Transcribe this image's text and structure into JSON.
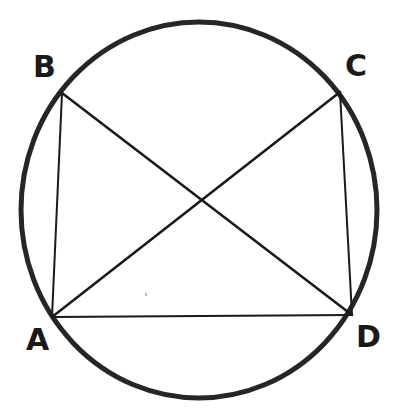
{
  "figure": {
    "background_color": "#ffffff",
    "stroke_color": "#1a1a1a",
    "circle_stroke_color": "#262626",
    "canvas": {
      "width": 403,
      "height": 420
    }
  },
  "circle": {
    "name": "circumscribed-circle",
    "cx": 199,
    "cy": 210,
    "rx": 178,
    "ry": 188,
    "stroke_width": 5
  },
  "vertices": [
    {
      "id": "A",
      "label": "A",
      "x": 52,
      "y": 317,
      "label_x": 26,
      "label_y": 325
    },
    {
      "id": "B",
      "label": "B",
      "x": 62,
      "y": 93,
      "label_x": 33,
      "label_y": 52
    },
    {
      "id": "C",
      "label": "C",
      "x": 340,
      "y": 92,
      "label_x": 345,
      "label_y": 51
    },
    {
      "id": "D",
      "label": "D",
      "x": 352,
      "y": 315,
      "label_x": 356,
      "label_y": 322
    }
  ],
  "segments": [
    {
      "id": "AB",
      "from": "A",
      "to": "B",
      "x1": 52,
      "y1": 317,
      "x2": 62,
      "y2": 93,
      "kind": "side",
      "stroke_width": 2
    },
    {
      "id": "AD",
      "from": "A",
      "to": "D",
      "x1": 52,
      "y1": 317,
      "x2": 352,
      "y2": 315,
      "kind": "side",
      "stroke_width": 2
    },
    {
      "id": "CD",
      "from": "C",
      "to": "D",
      "x1": 340,
      "y1": 92,
      "x2": 352,
      "y2": 315,
      "kind": "side",
      "stroke_width": 2
    },
    {
      "id": "AC",
      "from": "A",
      "to": "C",
      "x1": 52,
      "y1": 317,
      "x2": 340,
      "y2": 92,
      "kind": "diagonal",
      "stroke_width": 2.6
    },
    {
      "id": "BD",
      "from": "B",
      "to": "D",
      "x1": 62,
      "y1": 93,
      "x2": 352,
      "y2": 315,
      "kind": "diagonal",
      "stroke_width": 2.6
    }
  ],
  "intersection": {
    "id": "P",
    "label": "",
    "x": 200,
    "y": 197
  },
  "artifacts": [
    {
      "id": "speck",
      "x": 145,
      "y": 293,
      "color": "#bdbdbd"
    }
  ]
}
